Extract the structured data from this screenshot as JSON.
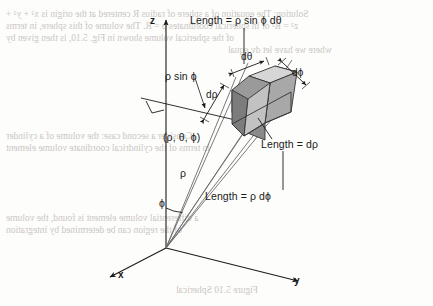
{
  "figure": {
    "background_color": "#fdfdfc",
    "ink_color": "#1a1a1a"
  },
  "axes": {
    "z_label": "z",
    "x_label": "x",
    "y_label": "y",
    "origin": {
      "x": 166,
      "y": 248
    }
  },
  "angles": {
    "phi_label": "ϕ",
    "rho_label": "ρ"
  },
  "labels": {
    "length_rho_sin_phi_dtheta": "Length = ρ sin ϕ dθ",
    "rho_sin_phi": "ρ sin ϕ",
    "d_rho": "dρ",
    "d_theta": "dθ",
    "d_phi": "dϕ",
    "point_coords": "(ρ, θ, ϕ)",
    "length_d_rho": "Length = dρ",
    "length_rho_d_phi": "Length = ρ dϕ"
  },
  "volume_element": {
    "name": "parallelepiped",
    "face_colors": {
      "front_left_dark": "#7e7e7e",
      "front_lower_dark": "#8c8c8c",
      "front_mid": "#b0b0b0",
      "right_mid": "#9b9b9b",
      "top_light": "#d2d2d2",
      "top_far_light": "#c6c6c6",
      "inner_light": "#dcdcdc"
    },
    "edge_color": "#333333",
    "hidden_edge_style": "dashed"
  },
  "bleed_through_text": [
    {
      "text": "Solution:  The equation of a sphere of radius R centered at the origin is x² + y² +",
      "x": 6,
      "y": 10
    },
    {
      "text": "z² = R² or in spherical coordinates ρ = R. The volume of this sphere, in terms",
      "x": 6,
      "y": 22
    },
    {
      "text": "of the spherical volume shown in Fig. 5.10, is then given by",
      "x": 6,
      "y": 34
    },
    {
      "text": "where we have let dv equal",
      "x": 228,
      "y": 46
    },
    {
      "text": "Consider a second case: the volume of a cylinder",
      "x": 6,
      "y": 132
    },
    {
      "text": "in terms of the cylindrical coordinate volume element",
      "x": 6,
      "y": 144
    },
    {
      "text": "a differential volume element is found, the volume",
      "x": 6,
      "y": 214
    },
    {
      "text": "of the region can be determined by integration",
      "x": 6,
      "y": 226
    },
    {
      "text": "Figure 5.10  Spherical",
      "x": 176,
      "y": 286
    }
  ]
}
